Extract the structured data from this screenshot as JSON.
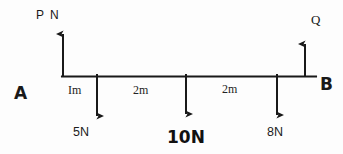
{
  "diagram": {
    "type": "free-body-beam-diagram",
    "beam": {
      "left_support_label": "A",
      "right_support_label": "B",
      "total_length_m": 5
    },
    "reactions": [
      {
        "id": "P",
        "label": "P N",
        "direction": "up",
        "position_m": 0
      },
      {
        "id": "Q",
        "label": "Q",
        "direction": "up",
        "position_m": 5
      }
    ],
    "loads": [
      {
        "id": "load-5n",
        "label": "5N",
        "direction": "down",
        "position_m": 1,
        "magnitude": 5,
        "unit": "N"
      },
      {
        "id": "load-10n",
        "label": "10N",
        "direction": "down",
        "position_m": 3,
        "magnitude": 10,
        "unit": "N"
      },
      {
        "id": "load-8n",
        "label": "8N",
        "direction": "down",
        "position_m": 5,
        "magnitude": 8,
        "unit": "N"
      }
    ],
    "dimensions": [
      {
        "id": "dim-1",
        "label": "Im",
        "from_m": 0,
        "to_m": 1
      },
      {
        "id": "dim-2",
        "label": "2m",
        "from_m": 1,
        "to_m": 3
      },
      {
        "id": "dim-3",
        "label": "2m",
        "from_m": 3,
        "to_m": 5
      }
    ],
    "colors": {
      "ink": "#191919",
      "background": "#fdfdfd"
    }
  }
}
